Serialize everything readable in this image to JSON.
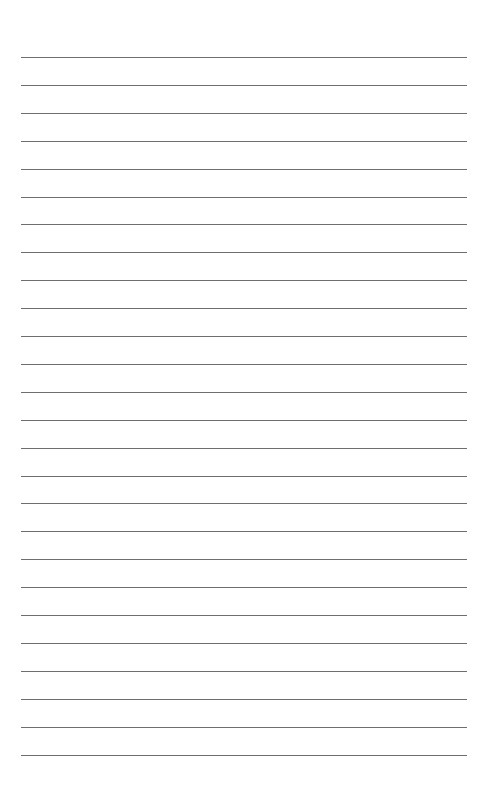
{
  "page": {
    "type": "lined-paper",
    "background_color": "#ffffff",
    "line_color": "#6e6e6e",
    "line_count": 26,
    "first_line_y": 57,
    "line_spacing": 27.9,
    "line_left": 21,
    "line_width": 446
  }
}
